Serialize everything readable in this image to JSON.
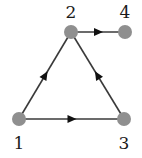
{
  "diagram": {
    "type": "directed-graph",
    "colors": {
      "node": "#8f8f8f",
      "edge": "#3a3a3a",
      "arrow": "#111111",
      "label": "#1a1a1a"
    },
    "nodes": [
      {
        "id": "1",
        "label": "1",
        "x": 19,
        "y": 119,
        "label_x": 19,
        "label_y": 149
      },
      {
        "id": "2",
        "label": "2",
        "x": 71,
        "y": 32,
        "label_x": 71,
        "label_y": 18
      },
      {
        "id": "3",
        "label": "3",
        "x": 124,
        "y": 119,
        "label_x": 124,
        "label_y": 149
      },
      {
        "id": "4",
        "label": "4",
        "x": 125,
        "y": 32,
        "label_x": 125,
        "label_y": 18
      }
    ],
    "edges": [
      {
        "from": "1",
        "to": "2"
      },
      {
        "from": "1",
        "to": "3"
      },
      {
        "from": "3",
        "to": "2"
      },
      {
        "from": "2",
        "to": "4"
      }
    ]
  }
}
